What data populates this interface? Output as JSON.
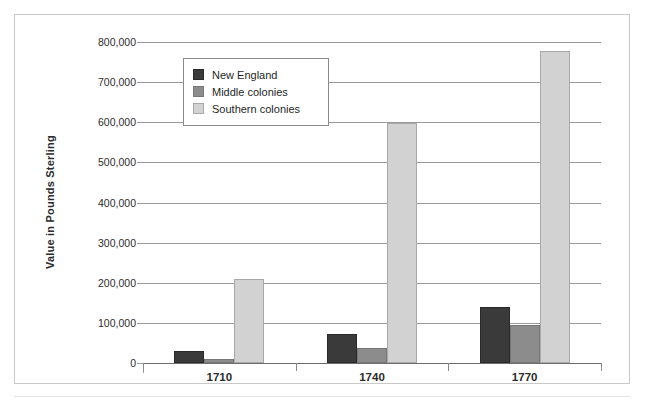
{
  "chart_data": {
    "type": "bar",
    "title": "",
    "subtitle": "",
    "xlabel": "",
    "ylabel": "Value in Pounds Sterling",
    "categories": [
      "1710",
      "1740",
      "1770"
    ],
    "series": [
      {
        "name": "New England",
        "color": "#3a3a3a",
        "values": [
          31000,
          72000,
          140000
        ]
      },
      {
        "name": "Middle colonies",
        "color": "#8c8c8c",
        "values": [
          11000,
          37000,
          95000
        ]
      },
      {
        "name": "Southern colonies",
        "color": "#d2d2d2",
        "values": [
          209000,
          598000,
          777000
        ]
      }
    ],
    "ylim": [
      0,
      800000
    ],
    "ytick_values": [
      0,
      100000,
      200000,
      300000,
      400000,
      500000,
      600000,
      700000,
      800000
    ],
    "ytick_labels": [
      "0",
      "100,000",
      "200,000",
      "300,000",
      "400,000",
      "500,000",
      "600,000",
      "700,000",
      "800,000"
    ],
    "grid": true,
    "grid_axis": "y",
    "legend_position": "upper-left-inside",
    "legend_entries": [
      "New England",
      "Middle colonies",
      "Southern colonies"
    ],
    "annotations": []
  },
  "figure": {
    "background_color": "#ffffff",
    "border_color": "#c9c9c9",
    "axis_color": "#9a9a9a",
    "text_color": "#2b2b2b"
  }
}
